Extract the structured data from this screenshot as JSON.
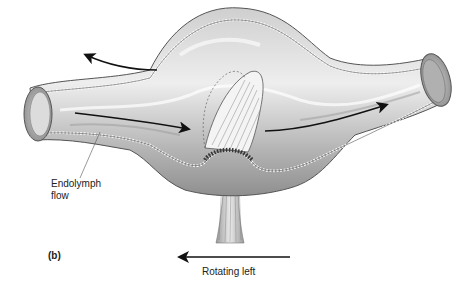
{
  "figure": {
    "panel_label": "(b)",
    "labels": {
      "endolymph_line1": "Endolymph",
      "endolymph_line2": "flow",
      "rotation": "Rotating left"
    },
    "arrows": [
      {
        "name": "upper-left-arrow",
        "direction": "left"
      },
      {
        "name": "left-canal-flow-arrow",
        "direction": "right"
      },
      {
        "name": "right-canal-flow-arrow",
        "direction": "right"
      },
      {
        "name": "rotation-arrow",
        "direction": "left"
      }
    ],
    "structures": [
      "semicircular-canal",
      "ampulla",
      "cupula",
      "hair-cells",
      "vestibular-nerve"
    ],
    "colors": {
      "tube_dark": "#8a8a8a",
      "tube_mid": "#bdbdbd",
      "tube_light": "#e6e6e6",
      "outline": "#555555",
      "arrow": "#111111"
    }
  }
}
